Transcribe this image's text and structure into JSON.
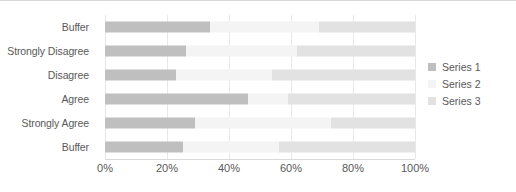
{
  "chart_data": {
    "type": "bar",
    "subtype": "stacked-horizontal",
    "title": "",
    "xlabel": "",
    "ylabel": "",
    "xlim": [
      0,
      100
    ],
    "xticks": [
      "0%",
      "20%",
      "40%",
      "60%",
      "80%",
      "100%"
    ],
    "xtick_values": [
      0,
      20,
      40,
      60,
      80,
      100
    ],
    "grid": true,
    "legend_position": "right",
    "categories": [
      "Buffer",
      "Strongly Disagree",
      "Disagree",
      "Agree",
      "Strongly Agree",
      "Buffer"
    ],
    "series": [
      {
        "name": "Series 1",
        "color": "#bfbfbf",
        "values": [
          34,
          26,
          23,
          46,
          29,
          25
        ]
      },
      {
        "name": "Series 2",
        "color": "#f4f4f4",
        "values": [
          35,
          36,
          31,
          13,
          44,
          31
        ]
      },
      {
        "name": "Series 3",
        "color": "#e2e2e2",
        "values": [
          31,
          38,
          46,
          41,
          27,
          44
        ]
      }
    ]
  },
  "legend": {
    "items": [
      {
        "label": "Series 1",
        "color": "#bfbfbf"
      },
      {
        "label": "Series 2",
        "color": "#f4f4f4"
      },
      {
        "label": "Series 3",
        "color": "#e2e2e2"
      }
    ]
  },
  "colors": {
    "gridline": "#e8e8e8",
    "axis": "#d9d9d9",
    "text": "#595959",
    "background": "#ffffff"
  }
}
